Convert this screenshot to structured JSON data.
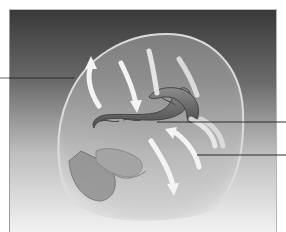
{
  "figure": {
    "background_gradient": {
      "top": "#3a3a3a",
      "middle": "#8a8a8a",
      "bottom": "#f2f2f2"
    },
    "colors": {
      "head_fill": "#c8c8c8",
      "head_outline": "#d9d9d9",
      "arrow": "#f4f4f4",
      "ventricle": "#6e6e6e",
      "ventricle_shade": "#4f4f4f",
      "skull_base": "#7a7a7a",
      "leader_line": "#2a2a2a"
    },
    "leader_lines": [
      {
        "side": "left",
        "y": 78,
        "x_start": 0,
        "x_end": 75,
        "target": "head-outline"
      },
      {
        "side": "right",
        "y": 122,
        "x_start": 157,
        "x_end": 286,
        "target": "ventricle"
      },
      {
        "side": "right",
        "y": 155,
        "x_start": 197,
        "x_end": 286,
        "target": "csf-space"
      }
    ],
    "labels": []
  }
}
